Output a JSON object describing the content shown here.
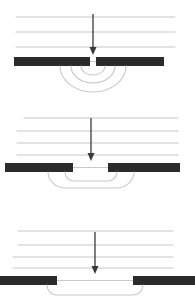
{
  "figure": {
    "background_color": "#ffffff",
    "width": 195,
    "height": 307,
    "barrier_color": "#2b2b2b",
    "wavefront_color": "#c8c8c8",
    "arrow_color": "#3a3a3a",
    "panel_count": 3
  },
  "chart_data": {
    "type": "diagram",
    "xlabel": "",
    "ylabel": "",
    "grid": false,
    "legend": null,
    "panels": [
      {
        "id": "panel-narrow-slit",
        "index": 1,
        "label": "narrow slit - strong diffraction",
        "slit_width": 5,
        "slit_center_x": 93,
        "barrier_y": 57,
        "barrier_height": 9,
        "barrier_left_start": 14,
        "barrier_left_end": 90,
        "barrier_right_start": 96,
        "barrier_right_end": 164,
        "incoming_wavefronts": [
          {
            "y": 17,
            "x1": 16,
            "x2": 175
          },
          {
            "y": 32,
            "x1": 16,
            "x2": 175
          },
          {
            "y": 47,
            "x1": 16,
            "x2": 175
          }
        ],
        "arrow": {
          "x": 93,
          "y_start": 14,
          "y_end": 55,
          "head_width": 7,
          "head_length": 8
        },
        "outgoing_wavefronts": [
          {
            "shape": "arc",
            "radius_x": 12,
            "radius_y": 9,
            "center_x": 93,
            "center_y": 66,
            "flat_half_width": 0
          },
          {
            "shape": "arc",
            "radius_x": 22,
            "radius_y": 17,
            "center_x": 93,
            "center_y": 66,
            "flat_half_width": 0
          },
          {
            "shape": "arc",
            "radius_x": 33,
            "radius_y": 26,
            "center_x": 93,
            "center_y": 66,
            "flat_half_width": 0
          }
        ]
      },
      {
        "id": "panel-medium-slit",
        "index": 2,
        "label": "medium slit - moderate diffraction",
        "slit_width": 35,
        "slit_center_x": 91,
        "barrier_y": 163,
        "barrier_height": 9,
        "barrier_left_start": 5,
        "barrier_left_end": 73,
        "barrier_right_start": 108,
        "barrier_right_end": 180,
        "incoming_wavefronts": [
          {
            "y": 118,
            "x1": 24,
            "x2": 178
          },
          {
            "y": 131,
            "x1": 17,
            "x2": 178
          },
          {
            "y": 143,
            "x1": 17,
            "x2": 178
          },
          {
            "y": 155,
            "x1": 17,
            "x2": 178
          }
        ],
        "arrow": {
          "x": 91,
          "y_start": 118,
          "y_end": 161,
          "head_width": 7,
          "head_length": 8
        },
        "outgoing_wavefronts": [
          {
            "shape": "flat-arc",
            "radius_x": 9,
            "radius_y": 9,
            "center_x": 91,
            "center_y": 172,
            "flat_half_width": 17
          },
          {
            "shape": "flat-arc",
            "radius_x": 18,
            "radius_y": 16,
            "center_x": 91,
            "center_y": 172,
            "flat_half_width": 25
          }
        ]
      },
      {
        "id": "panel-wide-slit",
        "index": 3,
        "label": "wide slit - minimal diffraction",
        "slit_width": 76,
        "slit_center_x": 95,
        "barrier_y": 276,
        "barrier_height": 9,
        "barrier_left_start": 0,
        "barrier_left_end": 57,
        "barrier_right_start": 133,
        "barrier_right_end": 195,
        "incoming_wavefronts": [
          {
            "y": 231,
            "x1": 18,
            "x2": 173
          },
          {
            "y": 245,
            "x1": 18,
            "x2": 173
          },
          {
            "y": 257,
            "x1": 13,
            "x2": 173
          },
          {
            "y": 268,
            "x1": 13,
            "x2": 173
          }
        ],
        "arrow": {
          "x": 95,
          "y_start": 232,
          "y_end": 274,
          "head_width": 7,
          "head_length": 8
        },
        "outgoing_wavefronts": [
          {
            "shape": "flat-arc",
            "radius_x": 10,
            "radius_y": 10,
            "center_x": 95,
            "center_y": 285,
            "flat_half_width": 38
          }
        ]
      }
    ]
  }
}
